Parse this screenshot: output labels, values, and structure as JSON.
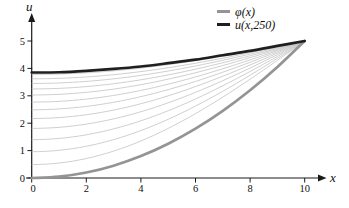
{
  "figure": {
    "background": "#ffffff",
    "axis_color": "#1a1a1a",
    "legend": [
      {
        "id": "phi",
        "label": "φ(x)",
        "color": "#949494"
      },
      {
        "id": "u250",
        "label": "u(x,250)",
        "color": "#1f1f1f"
      }
    ]
  },
  "chart_data": {
    "type": "line",
    "title": "",
    "xlabel": "x",
    "ylabel": "u",
    "xlim": [
      0,
      10
    ],
    "ylim": [
      0,
      5
    ],
    "xticks": [
      0,
      2,
      4,
      6,
      8,
      10
    ],
    "yticks": [
      0,
      1,
      2,
      3,
      4,
      5
    ],
    "grid": false,
    "legend_position": "top-right",
    "series": [
      {
        "name": "phi",
        "label": "φ(x)",
        "role": "initial condition (thick gray)",
        "color": "#949494",
        "width": 2.7,
        "x": [
          0,
          1,
          2,
          3,
          4,
          5,
          6,
          7,
          8,
          9,
          10
        ],
        "y": [
          0,
          0.05,
          0.2,
          0.45,
          0.8,
          1.25,
          1.8,
          2.45,
          3.2,
          4.05,
          5
        ]
      },
      {
        "name": "u_x_250",
        "label": "u(x,250)",
        "role": "solution snapshot at t=250 (thick dark)",
        "color": "#1f1f1f",
        "width": 2.7,
        "x": [
          0,
          1,
          2,
          3,
          4,
          5,
          6,
          7,
          8,
          9,
          10
        ],
        "y": [
          3.85,
          3.86,
          3.91,
          3.98,
          4.07,
          4.19,
          4.32,
          4.48,
          4.64,
          4.82,
          5
        ]
      }
    ],
    "intermediate_family": {
      "description": "thin gray curves: u(x,t) at successive times rising from φ(x) toward u(x,250); all pass through (10,5)",
      "color": "#c3c3c3",
      "width": 0.8,
      "boundary_value_at_x10": 5,
      "shape": "u(x) = 5 + (u0 - 5)*cos(pi*x/20)",
      "u0_values": [
        0.49,
        0.96,
        1.4,
        1.81,
        2.17,
        2.49,
        2.77,
        3.03,
        3.25,
        3.45,
        3.62,
        3.78
      ]
    }
  }
}
